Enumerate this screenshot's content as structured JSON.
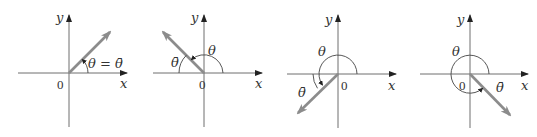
{
  "figure": {
    "colors": {
      "axis": "#6e6e6e",
      "ray": "#8c8c8c",
      "arc": "#444444",
      "text": "#333333"
    },
    "panels": [
      {
        "id": "quadrant-1",
        "origin_label": "0",
        "x_label": "x",
        "y_label": "y",
        "theta_label": "θ = θ̄",
        "ref_label": "",
        "ray_angle_deg": 40
      },
      {
        "id": "quadrant-2",
        "origin_label": "0",
        "x_label": "x",
        "y_label": "y",
        "theta_label": "θ",
        "ref_label": "θ̄",
        "ray_angle_deg": 140
      },
      {
        "id": "quadrant-3",
        "origin_label": "0",
        "x_label": "x",
        "y_label": "y",
        "theta_label": "θ",
        "ref_label": "θ̄",
        "ray_angle_deg": 215
      },
      {
        "id": "quadrant-4",
        "origin_label": "0",
        "x_label": "x",
        "y_label": "y",
        "theta_label": "θ",
        "ref_label": "θ̄",
        "ray_angle_deg": 315
      }
    ]
  }
}
